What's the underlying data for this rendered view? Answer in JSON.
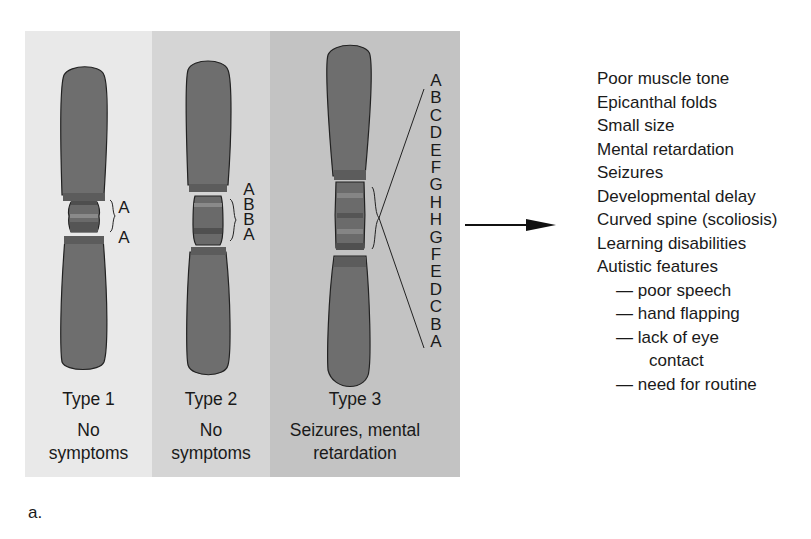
{
  "figure_label": "a.",
  "types": [
    {
      "title": "Type 1",
      "line1": "No",
      "line2": "symptoms",
      "letters": [
        "A",
        "A"
      ]
    },
    {
      "title": "Type 2",
      "line1": "No",
      "line2": "symptoms",
      "letters": [
        "A",
        "B",
        "B",
        "A"
      ]
    },
    {
      "title": "Type 3",
      "line1": "Seizures, mental",
      "line2": "retardation",
      "letters": [
        "A",
        "B",
        "C",
        "D",
        "E",
        "F",
        "G",
        "H",
        "H",
        "G",
        "F",
        "E",
        "D",
        "C",
        "B",
        "A"
      ]
    }
  ],
  "symptoms": {
    "items": [
      "Poor muscle tone",
      "Epicanthal folds",
      "Small size",
      "Mental retardation",
      "Seizures",
      "Developmental delay",
      "Curved spine (scoliosis)",
      "Learning disabilities",
      "Autistic features"
    ],
    "autistic_subitems": [
      {
        "dash": "—",
        "text": "poor speech"
      },
      {
        "dash": "—",
        "text": "hand flapping"
      },
      {
        "dash": "—",
        "text": "lack of eye"
      },
      {
        "dash": "",
        "text": "contact"
      },
      {
        "dash": "—",
        "text": "need for routine"
      }
    ]
  },
  "colors": {
    "chromosome": "#6e6e6e",
    "band": "#555555",
    "band_light": "#808080"
  }
}
